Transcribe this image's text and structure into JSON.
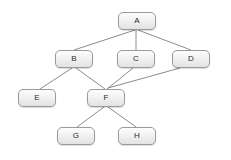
{
  "diagram": {
    "type": "directed-acyclic-graph",
    "canvas": {
      "width": 231,
      "height": 160,
      "background": "#ffffff"
    },
    "style": {
      "node_fill_top": "#fdfdfd",
      "node_fill_bottom": "#e2e2e2",
      "node_border": "#9a9a9a",
      "edge_color": "#6e6e6e",
      "label_color": "#2b2b2b"
    },
    "nodes": [
      {
        "id": "A",
        "label": "A",
        "x": 118,
        "y": 12,
        "w": 38,
        "h": 18,
        "level": 0
      },
      {
        "id": "B",
        "label": "B",
        "x": 55,
        "y": 50,
        "w": 38,
        "h": 18,
        "level": 1
      },
      {
        "id": "C",
        "label": "C",
        "x": 117,
        "y": 50,
        "w": 38,
        "h": 18,
        "level": 1
      },
      {
        "id": "D",
        "label": "D",
        "x": 172,
        "y": 50,
        "w": 38,
        "h": 18,
        "level": 1
      },
      {
        "id": "E",
        "label": "E",
        "x": 18,
        "y": 89,
        "w": 38,
        "h": 18,
        "level": 2
      },
      {
        "id": "F",
        "label": "F",
        "x": 87,
        "y": 89,
        "w": 38,
        "h": 18,
        "level": 2
      },
      {
        "id": "G",
        "label": "G",
        "x": 57,
        "y": 127,
        "w": 38,
        "h": 18,
        "level": 3
      },
      {
        "id": "H",
        "label": "H",
        "x": 118,
        "y": 127,
        "w": 38,
        "h": 18,
        "level": 3
      }
    ],
    "edges": [
      {
        "from": "A",
        "to": "B",
        "x1": 135,
        "y1": 30,
        "x2": 74,
        "y2": 50
      },
      {
        "from": "A",
        "to": "C",
        "x1": 136,
        "y1": 30,
        "x2": 136,
        "y2": 50
      },
      {
        "from": "A",
        "to": "D",
        "x1": 138,
        "y1": 30,
        "x2": 191,
        "y2": 50
      },
      {
        "from": "B",
        "to": "E",
        "x1": 72,
        "y1": 68,
        "x2": 40,
        "y2": 89
      },
      {
        "from": "B",
        "to": "F",
        "x1": 76,
        "y1": 68,
        "x2": 105,
        "y2": 89
      },
      {
        "from": "C",
        "to": "F",
        "x1": 133,
        "y1": 68,
        "x2": 107,
        "y2": 89
      },
      {
        "from": "D",
        "to": "F",
        "x1": 180,
        "y1": 68,
        "x2": 108,
        "y2": 88
      },
      {
        "from": "F",
        "to": "G",
        "x1": 104,
        "y1": 107,
        "x2": 77,
        "y2": 127
      },
      {
        "from": "F",
        "to": "H",
        "x1": 108,
        "y1": 107,
        "x2": 136,
        "y2": 127
      }
    ]
  }
}
